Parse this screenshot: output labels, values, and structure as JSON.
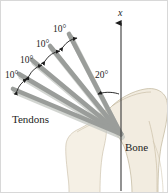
{
  "figure": {
    "background_color": "#ffffff",
    "border_color": "#d8d8d8",
    "width": 168,
    "height": 193
  },
  "colors": {
    "tendon": "#9a9d9a",
    "tendon_shadow": "#b9bcb8",
    "bone_fill": "#f2ece0",
    "bone_outline": "#a79a80",
    "axis": "#1d1d1d",
    "text": "#1d1d1d"
  },
  "axis": {
    "label": "x",
    "orientation": "vertical",
    "arrow_at": "top",
    "x_px": 120,
    "top_px": 20,
    "bottom_px": 190
  },
  "labels": {
    "tendons": "Tendons",
    "bone": "Bone",
    "axis_x": "x"
  },
  "angles": {
    "axis_to_first_tendon": "20°",
    "between_tendons": "10°",
    "between_tendons_list": [
      "10°",
      "10°",
      "10°",
      "10°"
    ]
  },
  "geometry": {
    "convergence_point": {
      "x": 120,
      "y": 133
    },
    "tendon_count": 5,
    "tendon_tips": [
      {
        "x": 68,
        "y": 33
      },
      {
        "x": 49,
        "y": 45
      },
      {
        "x": 31,
        "y": 59
      },
      {
        "x": 18,
        "y": 73
      },
      {
        "x": 12,
        "y": 88
      }
    ]
  },
  "annotations": [
    {
      "name": "angle-10-top",
      "text": "10°",
      "x": 52,
      "y": 28
    },
    {
      "name": "angle-10-second",
      "text": "10°",
      "x": 35,
      "y": 43
    },
    {
      "name": "angle-10-third",
      "text": "10°",
      "x": 19,
      "y": 59
    },
    {
      "name": "angle-10-bottom",
      "text": "10°",
      "x": 5,
      "y": 77
    },
    {
      "name": "angle-20-axis",
      "text": "20°",
      "x": 95,
      "y": 72
    }
  ]
}
